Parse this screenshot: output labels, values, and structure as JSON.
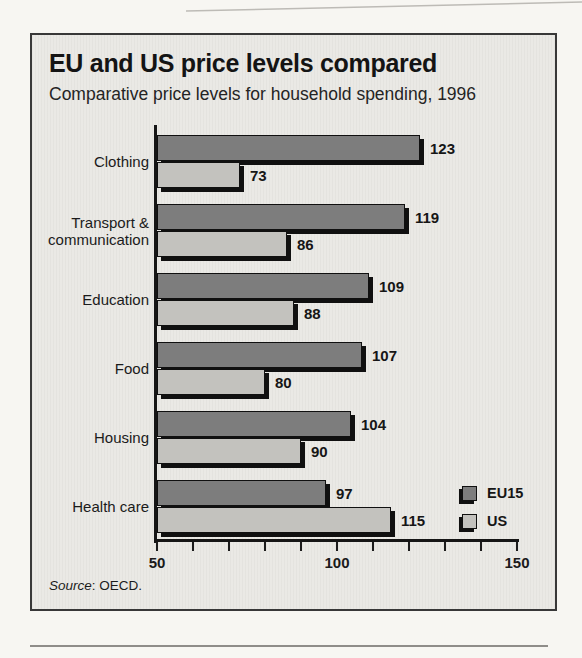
{
  "title": "EU and US price levels compared",
  "subtitle": "Comparative price levels for household spending, 1996",
  "source": {
    "label": "Source",
    "rest": ": OECD."
  },
  "chart_data": {
    "type": "bar",
    "orientation": "horizontal",
    "title": "EU and US price levels compared",
    "subtitle": "Comparative price levels for household spending, 1996",
    "categories": [
      "Clothing",
      "Transport & communication",
      "Education",
      "Food",
      "Housing",
      "Health care"
    ],
    "series": [
      {
        "name": "EU15",
        "color": "#7d7d7d",
        "values": [
          123,
          119,
          109,
          107,
          104,
          97
        ]
      },
      {
        "name": "US",
        "color": "#c3c2be",
        "values": [
          73,
          86,
          88,
          80,
          90,
          115
        ]
      }
    ],
    "value_labels_shown": true,
    "xlim": [
      50,
      150
    ],
    "xticks": [
      50,
      100,
      150
    ],
    "minor_tick_step": 10,
    "grid": false,
    "legend_position": "bottom-right",
    "source": "OECD"
  },
  "colors": {
    "page_background": "#f7f6f2",
    "box_background": "#eae9e5",
    "axis": "#161616",
    "bar_shadow": "#101010",
    "text": "#1a1a1a"
  }
}
